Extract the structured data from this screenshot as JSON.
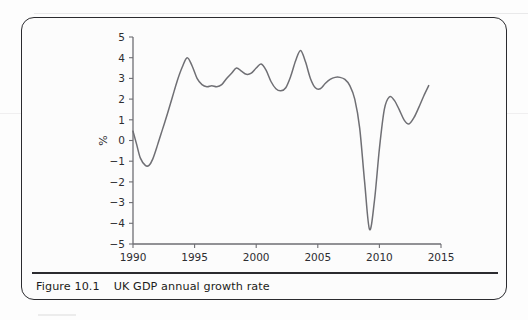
{
  "figure": {
    "number_label": "Figure 10.1",
    "caption": "UK GDP annual growth rate"
  },
  "chart_data": {
    "type": "line",
    "title": "UK GDP annual growth rate",
    "xlabel": "",
    "ylabel": "%",
    "xlim": [
      1990,
      2015
    ],
    "ylim": [
      -5,
      5
    ],
    "grid": false,
    "legend": "none",
    "x_ticks": [
      1990,
      1995,
      2000,
      2005,
      2010,
      2015
    ],
    "x_tick_labels": [
      "1990",
      "1995",
      "2000",
      "2005",
      "2010",
      "2015"
    ],
    "y_ticks": [
      -5,
      -4,
      -3,
      -2,
      -1,
      0,
      1,
      2,
      3,
      4,
      5
    ],
    "y_tick_labels": [
      "-5",
      "-4",
      "-3",
      "-2",
      "-1",
      "0",
      "1",
      "2",
      "3",
      "4",
      "5"
    ],
    "series": [
      {
        "name": "UK GDP annual growth rate",
        "color": "#6f6f74",
        "x": [
          1990.0,
          1990.3,
          1990.6,
          1991.0,
          1991.3,
          1991.6,
          1992.0,
          1992.4,
          1992.8,
          1993.2,
          1993.6,
          1994.0,
          1994.4,
          1994.8,
          1995.2,
          1995.6,
          1996.0,
          1996.4,
          1996.8,
          1997.2,
          1997.6,
          1998.0,
          1998.4,
          1998.8,
          1999.2,
          1999.6,
          2000.0,
          2000.4,
          2000.8,
          2001.2,
          2001.6,
          2002.0,
          2002.4,
          2002.8,
          2003.2,
          2003.6,
          2004.0,
          2004.4,
          2004.8,
          2005.2,
          2005.6,
          2006.0,
          2006.4,
          2006.8,
          2007.2,
          2007.6,
          2008.0,
          2008.4,
          2008.8,
          2009.2,
          2009.6,
          2010.0,
          2010.4,
          2010.8,
          2011.2,
          2011.6,
          2012.0,
          2012.4,
          2012.8,
          2013.2,
          2013.6,
          2014.0
        ],
        "y": [
          0.45,
          -0.2,
          -0.85,
          -1.2,
          -1.2,
          -0.9,
          -0.2,
          0.55,
          1.3,
          2.1,
          2.9,
          3.55,
          4.0,
          3.6,
          3.0,
          2.7,
          2.6,
          2.65,
          2.6,
          2.7,
          3.0,
          3.25,
          3.5,
          3.35,
          3.2,
          3.25,
          3.5,
          3.7,
          3.4,
          2.85,
          2.5,
          2.4,
          2.55,
          3.1,
          3.85,
          4.35,
          3.8,
          3.0,
          2.55,
          2.5,
          2.75,
          2.95,
          3.05,
          3.05,
          2.95,
          2.65,
          2.0,
          0.6,
          -2.0,
          -4.3,
          -2.9,
          -0.4,
          1.5,
          2.1,
          1.95,
          1.5,
          1.0,
          0.8,
          1.1,
          1.6,
          2.15,
          2.65
        ]
      }
    ],
    "annotations": []
  }
}
